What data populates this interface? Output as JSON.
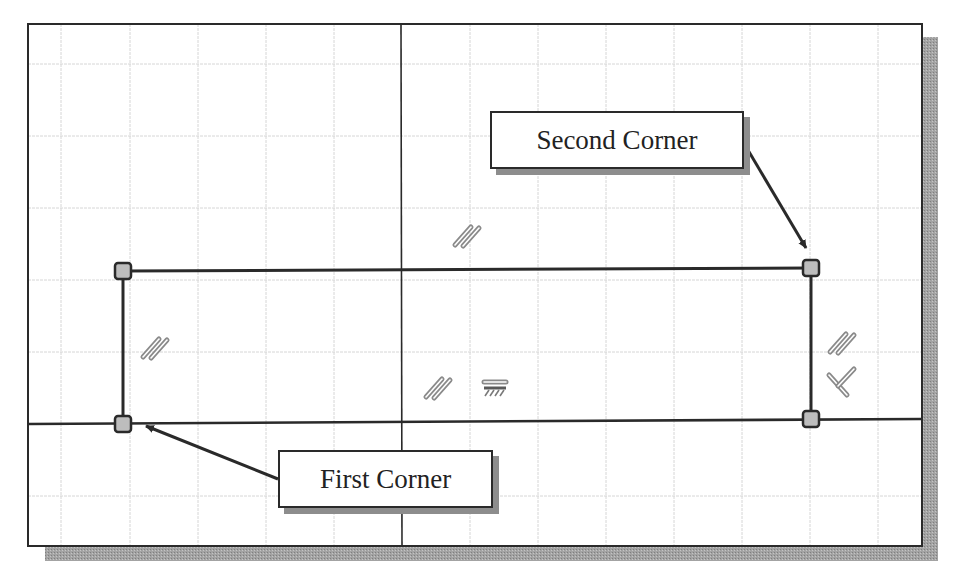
{
  "diagram": {
    "colors": {
      "background": "#ffffff",
      "frame": "#2a2a2a",
      "grid": "#d4d4d4",
      "shadow": "#9a9a9a",
      "marker_fill": "#bdbdbd",
      "constraint_icon": "#9a9a9a"
    },
    "frame": {
      "x": 28,
      "y": 24,
      "width": 894,
      "height": 522
    },
    "axes": {
      "vertical_x": 401,
      "horizontal_y": 424
    },
    "grid": {
      "vertical_lines": [
        61,
        130,
        198,
        266,
        334,
        470,
        538,
        606,
        674,
        742,
        810,
        878
      ],
      "horizontal_lines": [
        64,
        136,
        208,
        280,
        352,
        496
      ]
    },
    "rectangle": {
      "x1": 123,
      "y1": 269,
      "x2": 811,
      "y2": 421
    },
    "corner_points": [
      {
        "name": "top-left",
        "x": 123,
        "y": 271
      },
      {
        "name": "top-right",
        "x": 811,
        "y": 268
      },
      {
        "name": "bottom-left",
        "x": 123,
        "y": 424
      },
      {
        "name": "bottom-right",
        "x": 811,
        "y": 419
      }
    ],
    "constraints": [
      {
        "type": "parallel",
        "x": 467,
        "y": 236
      },
      {
        "type": "parallel",
        "x": 155,
        "y": 348
      },
      {
        "type": "parallel",
        "x": 438,
        "y": 388
      },
      {
        "type": "horizontal",
        "x": 495,
        "y": 387
      },
      {
        "type": "parallel",
        "x": 842,
        "y": 343
      },
      {
        "type": "perpendicular",
        "x": 842,
        "y": 383
      }
    ],
    "callouts": {
      "second_corner": {
        "label": "Second Corner"
      },
      "first_corner": {
        "label": "First Corner"
      }
    }
  }
}
